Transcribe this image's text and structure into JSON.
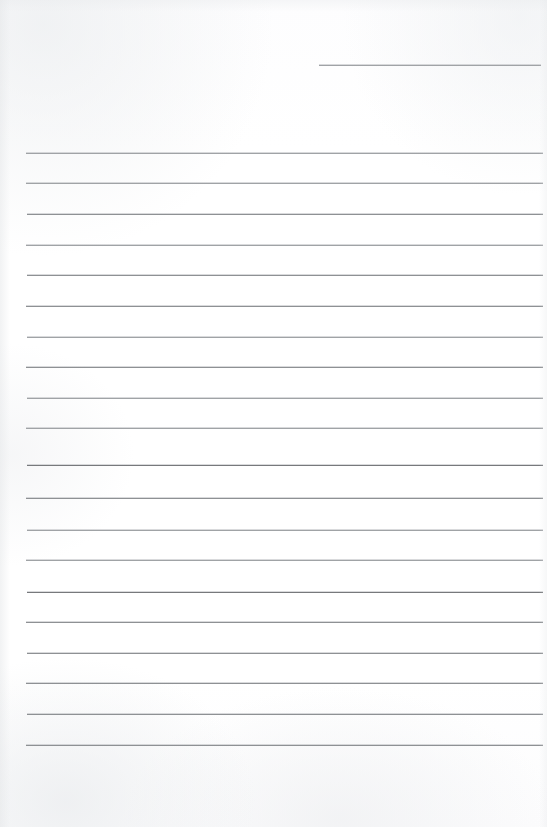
{
  "document": {
    "kind": "scanned-blank-ruled-paper",
    "page_width": 547,
    "page_height": 827,
    "background_color": "#fefefe",
    "rule_color": "#8e9194",
    "rule_color_dark": "#77797c",
    "rule_color_light": "#a0a3a6",
    "text_content": "",
    "header_text": "",
    "footer_text": "",
    "page_number": ""
  },
  "header_rule": {
    "label": "header-rule",
    "x": 319,
    "y": 65,
    "width": 222,
    "tone": "light"
  },
  "body_rules": [
    {
      "index": 1,
      "y": 153,
      "x": 26,
      "width": 517,
      "tone": "light"
    },
    {
      "index": 2,
      "y": 183,
      "x": 26,
      "width": 517,
      "tone": "light"
    },
    {
      "index": 3,
      "y": 214,
      "x": 27,
      "width": 516,
      "tone": "normal"
    },
    {
      "index": 4,
      "y": 245,
      "x": 26,
      "width": 517,
      "tone": "light"
    },
    {
      "index": 5,
      "y": 275,
      "x": 27,
      "width": 516,
      "tone": "normal"
    },
    {
      "index": 6,
      "y": 306,
      "x": 26,
      "width": 517,
      "tone": "normal"
    },
    {
      "index": 7,
      "y": 337,
      "x": 27,
      "width": 516,
      "tone": "light"
    },
    {
      "index": 8,
      "y": 367,
      "x": 26,
      "width": 517,
      "tone": "normal"
    },
    {
      "index": 9,
      "y": 398,
      "x": 27,
      "width": 516,
      "tone": "light"
    },
    {
      "index": 10,
      "y": 428,
      "x": 26,
      "width": 517,
      "tone": "light"
    },
    {
      "index": 11,
      "y": 465,
      "x": 27,
      "width": 516,
      "tone": "dark"
    },
    {
      "index": 12,
      "y": 498,
      "x": 26,
      "width": 517,
      "tone": "normal"
    },
    {
      "index": 13,
      "y": 530,
      "x": 27,
      "width": 516,
      "tone": "light"
    },
    {
      "index": 14,
      "y": 560,
      "x": 26,
      "width": 517,
      "tone": "light"
    },
    {
      "index": 15,
      "y": 592,
      "x": 27,
      "width": 516,
      "tone": "dark"
    },
    {
      "index": 16,
      "y": 622,
      "x": 26,
      "width": 517,
      "tone": "normal"
    },
    {
      "index": 17,
      "y": 653,
      "x": 27,
      "width": 516,
      "tone": "normal"
    },
    {
      "index": 18,
      "y": 683,
      "x": 26,
      "width": 517,
      "tone": "normal"
    },
    {
      "index": 19,
      "y": 714,
      "x": 27,
      "width": 516,
      "tone": "normal"
    },
    {
      "index": 20,
      "y": 745,
      "x": 26,
      "width": 517,
      "tone": "normal"
    }
  ]
}
